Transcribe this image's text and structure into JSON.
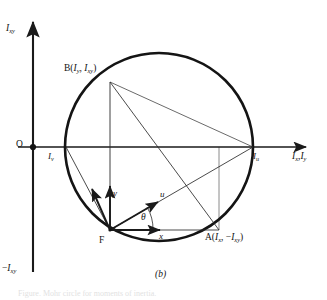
{
  "figure": {
    "caption": "(b)",
    "type": "mohr-circle-moments-of-inertia",
    "background_color": "#ffffff",
    "line_color": "#141414",
    "axis_color": "#222222"
  },
  "axes": {
    "vertical_top_label_main": "I",
    "vertical_top_label_sub": "xy",
    "vertical_bottom_label_sign": "−",
    "vertical_bottom_label_main": "I",
    "vertical_bottom_label_sub": "xy",
    "horizontal_label_main_1": "I",
    "horizontal_label_sub_1": "x",
    "horizontal_label_separator": ",",
    "horizontal_label_main_2": "I",
    "horizontal_label_sub_2": "y",
    "origin_label": "O"
  },
  "points": {
    "origin": {
      "label": "O",
      "x": 33,
      "y": 147
    },
    "B": {
      "label_prefix": "B(",
      "main_1": "I",
      "sub_1": "y",
      "separator": ", ",
      "main_2": "I",
      "sub_2": "xy",
      "label_suffix": ")",
      "x": 110,
      "y": 82
    },
    "A": {
      "label_prefix": "A(",
      "main_1": "I",
      "sub_1": "x",
      "separator": ", −",
      "main_2": "I",
      "sub_2": "xy",
      "label_suffix": ")",
      "x": 219,
      "y": 230
    },
    "F": {
      "label": "F",
      "x": 110,
      "y": 230
    },
    "Iu": {
      "main": "I",
      "sub": "u",
      "x": 253,
      "y": 147
    },
    "Iv": {
      "main": "I",
      "sub": "v",
      "x": 66,
      "y": 147
    }
  },
  "vectors": {
    "u": {
      "label": "u",
      "tip_x": 159,
      "tip_y": 200
    },
    "v": {
      "label": "v",
      "tip_x": 93,
      "tip_y": 186
    },
    "x": {
      "label": "x",
      "tip_x": 162,
      "tip_y": 230
    },
    "y": {
      "label": "y",
      "tip_x": 110,
      "tip_y": 183
    }
  },
  "angle": {
    "label": "θ",
    "vertex_x": 110,
    "vertex_y": 230
  },
  "circle": {
    "center_x": 159,
    "center_y": 147,
    "radius": 94
  },
  "bottom_text_fragment": "Figure. Mohr circle for moments of inertia."
}
